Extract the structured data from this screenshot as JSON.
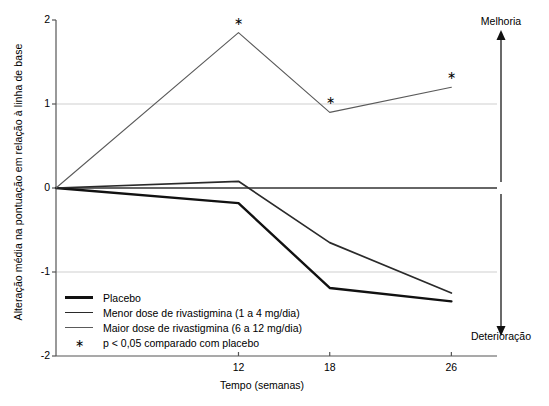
{
  "chart_data": {
    "type": "line",
    "title": "",
    "xlabel": "Tempo (semanas)",
    "ylabel": "Alteração média na pontuação em relação à linha de base",
    "x": [
      0,
      12,
      18,
      26
    ],
    "xticks": [
      12,
      18,
      26
    ],
    "xtick_labels": [
      "12",
      "18",
      "26"
    ],
    "yticks": [
      2,
      1,
      0,
      -1,
      -2
    ],
    "ytick_labels": [
      "2",
      "1",
      "0",
      "-1",
      "-2"
    ],
    "xlim": [
      0,
      29
    ],
    "ylim": [
      -2,
      2
    ],
    "grid": true,
    "gridlines": [
      1,
      -1
    ],
    "zero_line": 0,
    "legend_position": "lower-left-inside",
    "series": [
      {
        "name": "Placebo",
        "values": [
          0,
          -0.18,
          -1.19,
          -1.35
        ],
        "color": "#111111",
        "width": 2.4,
        "significant": []
      },
      {
        "name": "Menor dose de rivastigmina (1 a 4 mg/dia)",
        "values": [
          0,
          0.08,
          -0.65,
          -1.25
        ],
        "color": "#2a2a2a",
        "width": 1.7,
        "significant": []
      },
      {
        "name": "Maior dose de rivastigmina (6 a 12 mg/dia)",
        "values": [
          0,
          1.85,
          0.9,
          1.2
        ],
        "color": "#5a5a5a",
        "width": 1.1,
        "significant": [
          12,
          18,
          26
        ]
      }
    ],
    "significance_marker": "∗",
    "annotations": [
      {
        "text": "Melhoria",
        "position": "top-right",
        "arrow": "up"
      },
      {
        "text": "Deterioração",
        "position": "bottom-right",
        "arrow": "down"
      }
    ],
    "footnote": "p < 0,05 comparado com placebo"
  },
  "legend": {
    "items": [
      {
        "label": "Placebo",
        "swatch": "line-thick"
      },
      {
        "label": "Menor dose de rivastigmina (1 a 4 mg/dia)",
        "swatch": "line-medium"
      },
      {
        "label": "Maior dose de rivastigmina (6 a 12 mg/dia)",
        "swatch": "line-thin"
      },
      {
        "label": "p < 0,05 comparado com placebo",
        "swatch": "asterisk"
      }
    ]
  },
  "axis": {
    "x_title": "Tempo (semanas)",
    "y_title": "Alteração média na pontuação em relação à linha de base",
    "x_tick_12": "12",
    "x_tick_18": "18",
    "x_tick_26": "26",
    "y_tick_2": "2",
    "y_tick_1": "1",
    "y_tick_0": "0",
    "y_tick_neg1": "-1",
    "y_tick_neg2": "-2"
  },
  "side_annotations": {
    "improvement": "Melhoria",
    "deterioration": "Deterioração"
  },
  "markers": {
    "star": "∗"
  }
}
